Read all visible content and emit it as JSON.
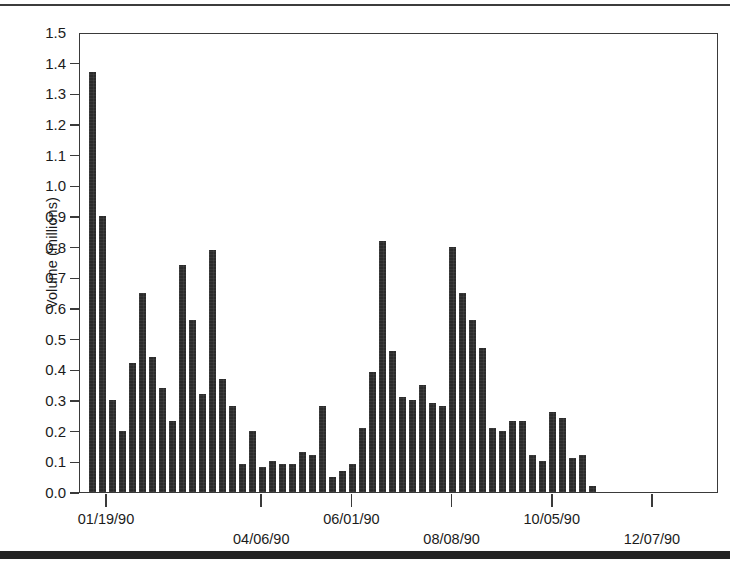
{
  "figure": {
    "bar_color": "#2b2b2b",
    "frame_color": "#3a3a3a",
    "background": "#ffffff"
  },
  "chart_data": {
    "type": "bar",
    "title": "",
    "xlabel": "",
    "ylabel": "Volume (millions)",
    "ylim": [
      0.0,
      1.5
    ],
    "xlim": [
      0,
      62
    ],
    "grid": false,
    "legend": null,
    "ytick_labels": [
      "1.5",
      "1.4",
      "1.3",
      "1.2",
      "1.1",
      "1.0",
      "0.9",
      "0.8",
      "0.7",
      "0.6",
      "0.5",
      "0.4",
      "0.3",
      "0.2",
      "0.1",
      "0.0"
    ],
    "ytick_values": [
      1.5,
      1.4,
      1.3,
      1.2,
      1.1,
      1.0,
      0.9,
      0.8,
      0.7,
      0.6,
      0.5,
      0.4,
      0.3,
      0.2,
      0.1,
      0.0
    ],
    "xtick_labels": [
      "01/19/90",
      "04/06/90",
      "06/01/90",
      "08/08/90",
      "10/05/90",
      "12/07/90"
    ],
    "xtick_indices": [
      1.5,
      17,
      26,
      36,
      46,
      56
    ],
    "xtick_rows": [
      0,
      1,
      0,
      1,
      0,
      1
    ],
    "categories": [
      "1",
      "2",
      "3",
      "4",
      "5",
      "6",
      "7",
      "8",
      "9",
      "10",
      "11",
      "12",
      "13",
      "14",
      "15",
      "16",
      "17",
      "18",
      "19",
      "20",
      "21",
      "22",
      "23",
      "24",
      "25",
      "26",
      "27",
      "28",
      "29",
      "30",
      "31",
      "32",
      "33",
      "34",
      "35",
      "36",
      "37",
      "38",
      "39",
      "40",
      "41",
      "42",
      "43",
      "44",
      "45",
      "46",
      "47",
      "48",
      "49",
      "50",
      "51",
      "52",
      "53",
      "54",
      "55",
      "56",
      "57",
      "58",
      "59",
      "60",
      "61",
      "62"
    ],
    "values": [
      1.37,
      0.9,
      0.3,
      0.2,
      0.42,
      0.65,
      0.44,
      0.34,
      0.23,
      0.74,
      0.56,
      0.32,
      0.79,
      0.37,
      0.28,
      0.09,
      0.2,
      0.08,
      0.1,
      0.09,
      0.09,
      0.13,
      0.12,
      0.28,
      0.05,
      0.07,
      0.09,
      0.21,
      0.39,
      0.82,
      0.46,
      0.31,
      0.3,
      0.35,
      0.29,
      0.28,
      0.8,
      0.65,
      0.56,
      0.47,
      0.21,
      0.2,
      0.23,
      0.23,
      0.12,
      0.1,
      0.26,
      0.24,
      0.11,
      0.12,
      0.02,
      0.0,
      0.0,
      0.0,
      0.0,
      0.0,
      0.0,
      0.0,
      0.0,
      0.0,
      0.0,
      0.0
    ]
  }
}
